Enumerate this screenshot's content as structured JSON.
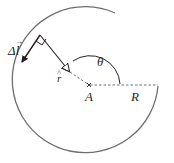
{
  "diagram": {
    "labels": {
      "delta_l": "Δl",
      "delta_l_arrow": "→",
      "r_hat": "r",
      "r_hat_accent": "^",
      "theta": "θ",
      "center": "A",
      "radius": "R"
    },
    "colors": {
      "stroke": "#6d6e71",
      "text": "#231f20",
      "arrow": "#231f20"
    }
  }
}
